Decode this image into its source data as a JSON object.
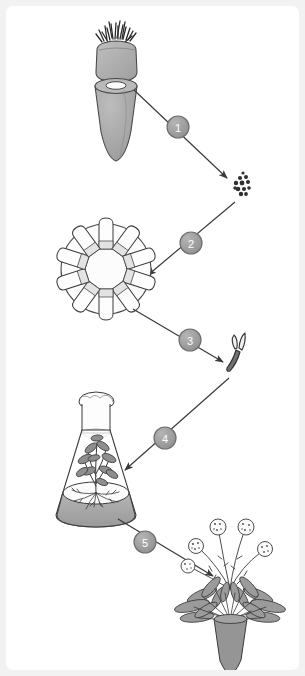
{
  "figure": {
    "background_color": "#f2f2f2",
    "panel_color": "#ffffff",
    "line_color": "#3a3a3a",
    "fill_gray": "#a8a8a8",
    "fill_light": "#d9d9d9",
    "fill_white": "#ffffff"
  },
  "steps": [
    {
      "id": 1,
      "label": "1",
      "cx": 172,
      "cy": 121,
      "radius": 11,
      "from": "carrot-root-explant-source",
      "to": "cell-cluster"
    },
    {
      "id": 2,
      "label": "2",
      "cx": 185,
      "cy": 237,
      "radius": 11,
      "from": "cell-cluster",
      "to": "culture-wheel"
    },
    {
      "id": 3,
      "label": "3",
      "cx": 184,
      "cy": 334,
      "radius": 11,
      "from": "culture-wheel",
      "to": "somatic-embryo"
    },
    {
      "id": 4,
      "label": "4",
      "cx": 159,
      "cy": 432,
      "radius": 11,
      "from": "somatic-embryo",
      "to": "flask-plantlet"
    },
    {
      "id": 5,
      "label": "5",
      "cx": 139,
      "cy": 536,
      "radius": 11,
      "from": "flask-plantlet",
      "to": "mature-carrot-plant"
    }
  ],
  "stages": [
    {
      "name": "carrot-crown",
      "description": "Severed carrot crown with cut leaf petiole stubs"
    },
    {
      "name": "carrot-root-explant-source",
      "description": "Carrot taproot section with exposed cambium ring cut surface"
    },
    {
      "name": "cell-cluster",
      "description": "Cluster of isolated single cells / callus cells"
    },
    {
      "name": "culture-wheel",
      "description": "Rotating culture wheel holding ten liquid medium tubes",
      "tube_count": 10
    },
    {
      "name": "somatic-embryo",
      "description": "Somatic embryo with cotyledons"
    },
    {
      "name": "flask-plantlet",
      "description": "Erlenmeyer flask with cotton plug containing rooted plantlet on agar medium"
    },
    {
      "name": "mature-carrot-plant",
      "description": "Mature flowering carrot plant with five umbels and tap root",
      "umbel_count": 5
    }
  ]
}
